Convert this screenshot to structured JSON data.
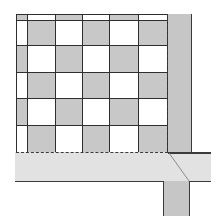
{
  "diagram": {
    "colors": {
      "tile_gray": "#c8c8c8",
      "tile_white": "#ffffff",
      "border_strip": "#c6c6c6",
      "threshold_strip": "#e2e2e2",
      "line": "#2e2e2e"
    },
    "grid": {
      "col_edges": [
        0,
        11,
        39,
        66,
        93,
        122,
        151
      ],
      "row_edges": [
        0,
        6,
        31,
        58,
        84,
        111,
        139
      ],
      "pattern": "gray when (row + col) is even"
    },
    "elements": [
      "checkerboard-tile-field",
      "vertical-border-strip",
      "horizontal-threshold-strip",
      "lower-vertical-strip",
      "dashed-edge-lines",
      "miter-joint-line"
    ]
  }
}
